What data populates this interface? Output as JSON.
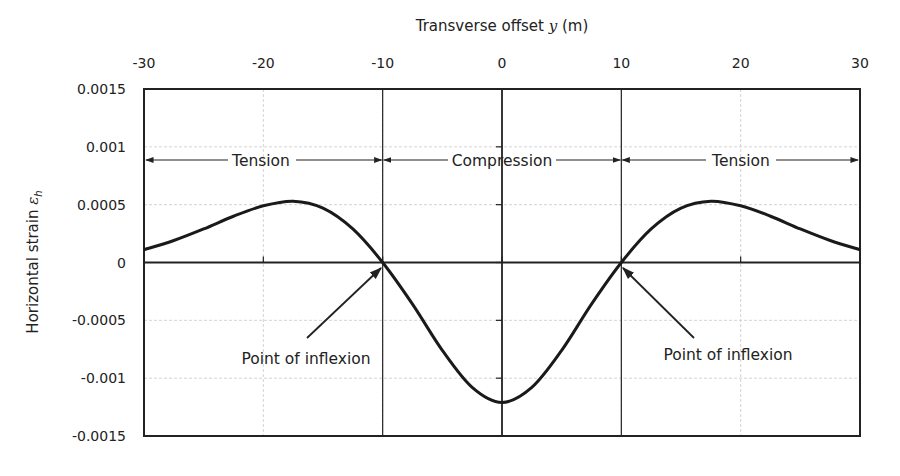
{
  "chart_data": {
    "type": "line",
    "title": "",
    "xlabel": "Transverse offset y (m)",
    "xlabel_parts": {
      "pre": "Transverse offset ",
      "var": "y",
      "post": " (m)"
    },
    "ylabel": "Horizontal strain ε_h",
    "ylabel_parts": {
      "pre": "Horizontal strain ",
      "var": "ε",
      "sub": "h"
    },
    "xlim": [
      -30,
      30
    ],
    "ylim": [
      -0.0015,
      0.0015
    ],
    "x_ticks": [
      "-30",
      "-20",
      "-10",
      "0",
      "10",
      "20",
      "30"
    ],
    "y_ticks": [
      "0.0015",
      "0.001",
      "0.0005",
      "0",
      "-0.0005",
      "-0.001",
      "-0.0015"
    ],
    "x_axis_position": "top",
    "grid": true,
    "legend": null,
    "series": [
      {
        "name": "Horizontal strain",
        "x": [
          -30,
          -27.5,
          -25,
          -22.5,
          -20,
          -17.5,
          -15,
          -12.5,
          -10,
          -7.5,
          -5,
          -2.5,
          0,
          2.5,
          5,
          7.5,
          10,
          12.5,
          15,
          17.5,
          20,
          22.5,
          25,
          27.5,
          30
        ],
        "values": [
          0.00011,
          0.00019,
          0.00029,
          0.0004,
          0.00049,
          0.00053,
          0.00047,
          0.00029,
          0.0,
          -0.00036,
          -0.00076,
          -0.00108,
          -0.00121,
          -0.00108,
          -0.00076,
          -0.00036,
          0.0,
          0.00029,
          0.00047,
          0.00053,
          0.00049,
          0.0004,
          0.00029,
          0.00019,
          0.00011
        ]
      }
    ],
    "annotations": [
      {
        "text": "Tension",
        "type": "double-arrow",
        "from": -30,
        "to": -10,
        "y": 0.00087
      },
      {
        "text": "Compression",
        "type": "double-arrow",
        "from": -10,
        "to": 10,
        "y": 0.00087
      },
      {
        "text": "Tension",
        "type": "double-arrow",
        "from": 10,
        "to": 30,
        "y": 0.00087
      },
      {
        "text": "Point of inflexion",
        "type": "arrow",
        "point": [
          -10,
          0
        ]
      },
      {
        "text": "Point of inflexion",
        "type": "arrow",
        "point": [
          10,
          0
        ]
      }
    ],
    "reference_lines": [
      {
        "type": "vertical",
        "x": -10
      },
      {
        "type": "vertical",
        "x": 0
      },
      {
        "type": "vertical",
        "x": 10
      },
      {
        "type": "horizontal",
        "y": 0
      }
    ]
  },
  "annotations": {
    "tension_left": "Tension",
    "compression": "Compression",
    "tension_right": "Tension",
    "inflexion_left": "Point of inflexion",
    "inflexion_right": "Point of inflexion"
  }
}
